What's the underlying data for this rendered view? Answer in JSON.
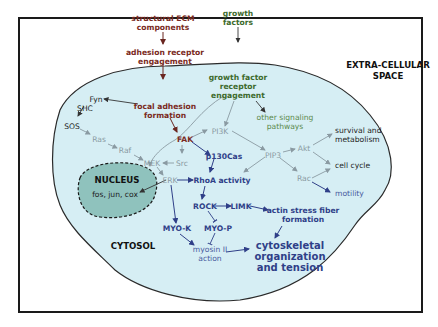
{
  "diagram": {
    "regions": {
      "extracellular": "EXTRA-CELLULAR",
      "extracellular_2": "SPACE",
      "cytosol": "CYTOSOL",
      "nucleus": "NUCLEUS",
      "nucleus_genes": "fos, jun, cox"
    },
    "colors": {
      "cell_fill": "#d6eef4",
      "nucleus_fill": "#8fc2bd",
      "ecm_path": "#7a2a22",
      "growth_path": "#3d6a2c",
      "grey_path": "#8a9aa2",
      "blue_path": "#2f3f88"
    },
    "nodes": {
      "structural_ecm_1": "structural ECM",
      "structural_ecm_2": "components",
      "adhesion_1": "adhesion receptor",
      "adhesion_2": "engagement",
      "focal_1": "focal adhesion",
      "focal_2": "formation",
      "growth_factors_1": "growth",
      "growth_factors_2": "factors",
      "gf_receptor_1": "growth factor",
      "gf_receptor_2": "receptor",
      "gf_receptor_3": "engagement",
      "other_1": "other signaling",
      "other_2": "pathways",
      "fyn": "Fyn",
      "shc": "SHC",
      "sos": "SOS",
      "ras": "Ras",
      "raf": "Raf",
      "mek": "MEK",
      "src": "Src",
      "fak": "FAK",
      "pi3k": "PI3K",
      "pip3": "PIP3",
      "akt": "Akt",
      "rac": "Rac",
      "p130cas": "p130Cas",
      "erk": "ERK",
      "rhoa": "RhoA activity",
      "rock": "ROCK",
      "limk": "LIMK",
      "actin_1": "actin stress fiber",
      "actin_2": "formation",
      "myok": "MYO-K",
      "myop": "MYO-P",
      "myosin_1": "myosin II",
      "myosin_2": "action",
      "cyto_1": "cytoskeletal",
      "cyto_2": "organization",
      "cyto_3": "and tension",
      "survival_1": "survival and",
      "survival_2": "metabolism",
      "cell_cycle": "cell cycle",
      "motility": "motility"
    }
  }
}
